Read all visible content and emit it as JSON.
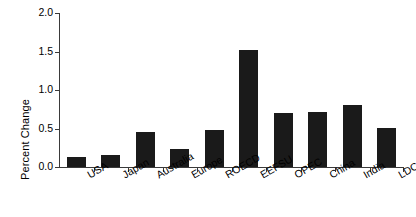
{
  "chart_data": {
    "type": "bar",
    "title": "",
    "subtitle": "",
    "xlabel": "",
    "ylabel": "Percent Change",
    "categories": [
      "USA",
      "Japan",
      "Australia",
      "Europe",
      "ROECD",
      "EEFSU",
      "OPEC",
      "China",
      "India",
      "LDC"
    ],
    "values": [
      0.13,
      0.15,
      0.45,
      0.23,
      0.48,
      1.52,
      0.7,
      0.72,
      0.8,
      0.51
    ],
    "ylim": [
      0.0,
      2.0
    ],
    "ytick_values": [
      0.0,
      0.5,
      1.0,
      1.5,
      2.0
    ],
    "ytick_labels": [
      "0.0",
      "0.5",
      "1.0",
      "1.5",
      "2.0"
    ],
    "grid": false,
    "legend": null,
    "bar_color": "#1a1a1a",
    "axis_color": "#3a3a3a",
    "background_color": "#ffffff",
    "xtick_label_rotation_deg": -30
  }
}
